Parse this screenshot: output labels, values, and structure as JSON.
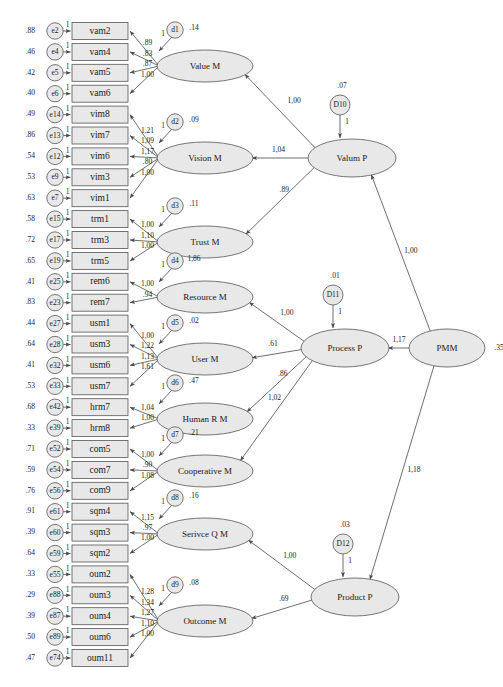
{
  "figure": {
    "type": "sem-path-diagram",
    "notation": "AMOS unstandardized estimates"
  },
  "indicators": [
    {
      "variance": ".88",
      "error": "e2",
      "name": "vam2",
      "loading": ".89",
      "fix": "1"
    },
    {
      "variance": ".46",
      "error": "e4",
      "name": "vam4",
      "loading": ".83",
      "fix": "1"
    },
    {
      "variance": ".42",
      "error": "e5",
      "name": "vam5",
      "loading": ".87",
      "fix": "1"
    },
    {
      "variance": ".40",
      "error": "e6",
      "name": "vam6",
      "loading": "1,00",
      "fix": "1"
    },
    {
      "variance": ".49",
      "error": "e14",
      "name": "vim8",
      "loading": "1,21",
      "fix": "1"
    },
    {
      "variance": ".86",
      "error": "e13",
      "name": "vim7",
      "loading": "1,09",
      "fix": "1"
    },
    {
      "variance": ".54",
      "error": "e12",
      "name": "vim6",
      "loading": "1,17",
      "fix": "1"
    },
    {
      "variance": ".53",
      "error": "e9",
      "name": "vim3",
      "loading": ".80",
      "fix": "1"
    },
    {
      "variance": ".63",
      "error": "e7",
      "name": "vim1",
      "loading": "1,00",
      "fix": "1"
    },
    {
      "variance": ".58",
      "error": "e15",
      "name": "trm1",
      "loading": "1,00",
      "fix": "1"
    },
    {
      "variance": ".72",
      "error": "e17",
      "name": "trm3",
      "loading": "1,10",
      "fix": "1"
    },
    {
      "variance": ".65",
      "error": "e19",
      "name": "trm5",
      "loading": "1,00",
      "fix": "1"
    },
    {
      "variance": ".41",
      "error": "e25",
      "name": "rem6",
      "loading": "1,00",
      "fix": "1"
    },
    {
      "variance": ".83",
      "error": "e23",
      "name": "rem7",
      "loading": ".94",
      "fix": "1"
    },
    {
      "variance": ".44",
      "error": "e27",
      "name": "usm1",
      "loading": "1,00",
      "fix": "1"
    },
    {
      "variance": ".64",
      "error": "e28",
      "name": "usm3",
      "loading": "1,22",
      "fix": "1"
    },
    {
      "variance": ".41",
      "error": "e32",
      "name": "usm6",
      "loading": "1,13",
      "fix": "1"
    },
    {
      "variance": ".53",
      "error": "e33",
      "name": "usm7",
      "loading": "1,61",
      "fix": "1"
    },
    {
      "variance": ".68",
      "error": "e42",
      "name": "hrm7",
      "loading": "1,04",
      "fix": "1"
    },
    {
      "variance": ".33",
      "error": "e39",
      "name": "hrm8",
      "loading": "1,00",
      "fix": "1"
    },
    {
      "variance": ".71",
      "error": "e52",
      "name": "com5",
      "loading": "1,00",
      "fix": "1"
    },
    {
      "variance": ".59",
      "error": "e54",
      "name": "com7",
      "loading": ".90",
      "fix": "1"
    },
    {
      "variance": ".76",
      "error": "e56",
      "name": "com9",
      "loading": "1,08",
      "fix": "1"
    },
    {
      "variance": ".91",
      "error": "e61",
      "name": "sqm4",
      "loading": "1,15",
      "fix": "1"
    },
    {
      "variance": ".39",
      "error": "e60",
      "name": "sqm3",
      "loading": ".97",
      "fix": "1"
    },
    {
      "variance": ".64",
      "error": "e59",
      "name": "sqm2",
      "loading": "1,00",
      "fix": "1"
    },
    {
      "variance": ".33",
      "error": "e55",
      "name": "oum2",
      "loading": "1,28",
      "fix": "1"
    },
    {
      "variance": ".29",
      "error": "e88",
      "name": "oum3",
      "loading": "1,34",
      "fix": "1"
    },
    {
      "variance": ".39",
      "error": "e87",
      "name": "oum4",
      "loading": "1,27",
      "fix": "1"
    },
    {
      "variance": ".50",
      "error": "e89",
      "name": "oum6",
      "loading": "1,10",
      "fix": "1"
    },
    {
      "variance": ".47",
      "error": "e74",
      "name": "oum11",
      "loading": "1,00",
      "fix": "1"
    }
  ],
  "measurement_factors": [
    {
      "id": "value",
      "label": "Value M",
      "disturbance": "d1",
      "dist_value": ".14",
      "dist_fix": "1"
    },
    {
      "id": "vision",
      "label": "Vision M",
      "disturbance": "d2",
      "dist_value": ".09",
      "dist_fix": "1"
    },
    {
      "id": "trust",
      "label": "Trust M",
      "disturbance": "d3",
      "dist_value": ".11",
      "dist_fix": "1"
    },
    {
      "id": "resource",
      "label": "Resource M",
      "disturbance": "d4",
      "dist_value": "1,86",
      "dist_fix": "1"
    },
    {
      "id": "user",
      "label": "User M",
      "disturbance": "d5",
      "dist_value": ".02",
      "dist_fix": "1"
    },
    {
      "id": "humanr",
      "label": "Human R M",
      "disturbance": "d6",
      "dist_value": ".47",
      "dist_fix": "1"
    },
    {
      "id": "cooperative",
      "label": "Cooperative M",
      "disturbance": "d7",
      "dist_value": ".21",
      "dist_fix": "1"
    },
    {
      "id": "serviceq",
      "label": "Serivce Q M",
      "disturbance": "d8",
      "dist_value": ".16",
      "dist_fix": "1"
    },
    {
      "id": "outcome",
      "label": "Outcome M",
      "disturbance": "d9",
      "dist_value": ".08",
      "dist_fix": "1"
    }
  ],
  "structural_factors": [
    {
      "id": "valum",
      "label": "Valum P",
      "disturbance": "D10",
      "dist_value": ".07",
      "dist_fix": "1"
    },
    {
      "id": "process",
      "label": "Process P",
      "disturbance": "D11",
      "dist_value": ".01",
      "dist_fix": "1"
    },
    {
      "id": "product",
      "label": "Product P",
      "disturbance": "D12",
      "dist_value": ".03",
      "dist_fix": "1"
    },
    {
      "id": "pmm",
      "label": "PMM",
      "variance": ".35"
    }
  ],
  "structural_paths": [
    {
      "from": "valum",
      "to": "value",
      "coef": "1,00"
    },
    {
      "from": "valum",
      "to": "vision",
      "coef": "1,04"
    },
    {
      "from": "valum",
      "to": "trust",
      "coef": ".89"
    },
    {
      "from": "process",
      "to": "resource",
      "coef": "1,00"
    },
    {
      "from": "process",
      "to": "user",
      "coef": ".61"
    },
    {
      "from": "process",
      "to": "humanr",
      "coef": ".86"
    },
    {
      "from": "process",
      "to": "cooperative",
      "coef": "1,02"
    },
    {
      "from": "product",
      "to": "serviceq",
      "coef": "1,00"
    },
    {
      "from": "product",
      "to": "outcome",
      "coef": ".69"
    },
    {
      "from": "pmm",
      "to": "valum",
      "coef": "1,00"
    },
    {
      "from": "pmm",
      "to": "process",
      "coef": "1,17"
    },
    {
      "from": "pmm",
      "to": "product",
      "coef": "1,18"
    }
  ]
}
